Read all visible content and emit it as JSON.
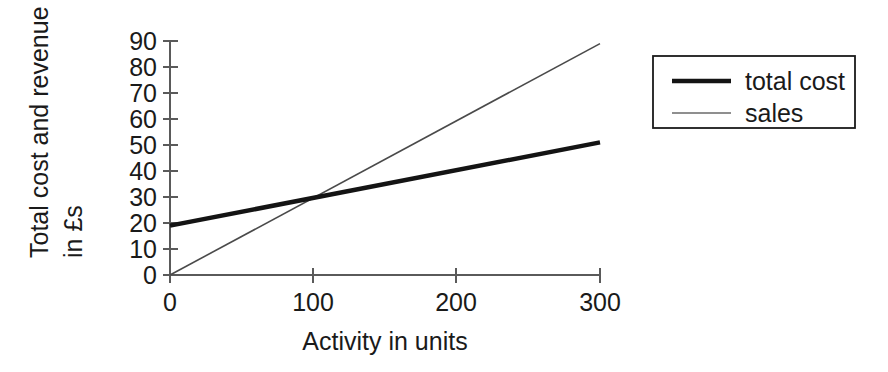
{
  "chart_data": {
    "type": "line",
    "title": "",
    "subtitle": "",
    "xlabel": "Activity in units",
    "ylabel_line1": "Total cost and revenue",
    "ylabel_line2": "in £s",
    "ylabel": "Total cost and revenue in £s",
    "xlim": [
      0,
      300
    ],
    "ylim": [
      0,
      90
    ],
    "xticks": [
      0,
      100,
      200,
      300
    ],
    "xtick_labels": [
      "0",
      "100",
      "200",
      "300"
    ],
    "yticks": [
      0,
      10,
      20,
      30,
      40,
      50,
      60,
      70,
      80,
      90
    ],
    "ytick_labels": [
      "0",
      "10",
      "20",
      "30",
      "40",
      "50",
      "60",
      "70",
      "80",
      "90"
    ],
    "grid": false,
    "legend_position": "right",
    "x": [
      0,
      300
    ],
    "series": [
      {
        "name": "total cost",
        "x": [
          0,
          300
        ],
        "values": [
          19,
          51
        ],
        "color": "#141414",
        "line_width": "thick"
      },
      {
        "name": "sales",
        "x": [
          0,
          300
        ],
        "values": [
          0,
          89
        ],
        "color": "#4a4a4a",
        "line_width": "thin"
      }
    ],
    "annotations": [
      {
        "name": "breakeven",
        "x": 100,
        "y": 30,
        "label": ""
      }
    ]
  },
  "axes": {
    "y_title_line1": "Total cost and revenue",
    "y_title_line2": "in £s",
    "x_title": "Activity in units"
  },
  "yticks": {
    "t0": "0",
    "t1": "10",
    "t2": "20",
    "t3": "30",
    "t4": "40",
    "t5": "50",
    "t6": "60",
    "t7": "70",
    "t8": "80",
    "t9": "90"
  },
  "xticks": {
    "t0": "0",
    "t1": "100",
    "t2": "200",
    "t3": "300"
  },
  "legend": {
    "entries": [
      {
        "label": "total cost"
      },
      {
        "label": "sales"
      }
    ],
    "entry0_label": "total cost",
    "entry1_label": "sales"
  },
  "colors": {
    "total_cost": "#141414",
    "sales": "#4a4a4a",
    "axis": "#5a5a5a",
    "text": "#1a1a1a",
    "background": "#ffffff"
  }
}
